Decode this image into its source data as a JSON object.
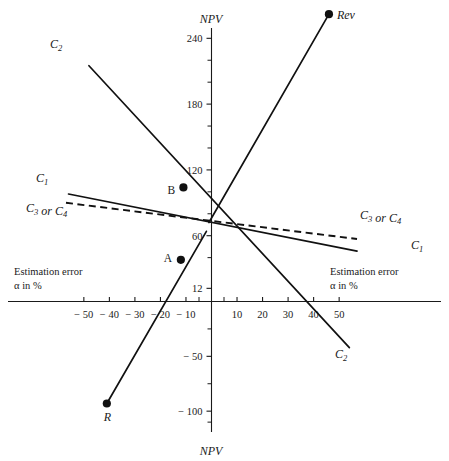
{
  "chart_data": {
    "type": "line",
    "title": "",
    "xlabel": "Estimation error α in %",
    "ylabel": "NPV",
    "axis_titles": {
      "y_top": "NPV",
      "y_bottom": "NPV",
      "x_left_line1": "Estimation error",
      "x_left_line2": "α in %",
      "x_right_line1": "Estimation error",
      "x_right_line2": "α in %"
    },
    "xlim": [
      -60,
      60
    ],
    "ylim": [
      -115,
      275
    ],
    "grid": false,
    "legend_position": "inline-endpoint-labels",
    "xticks": [
      -50,
      -40,
      -30,
      -20,
      -10,
      10,
      20,
      30,
      40,
      50
    ],
    "xtick_labels": [
      "− 50",
      "− 40",
      "− 30",
      "− 20",
      "− 10",
      "10",
      "20",
      "30",
      "40",
      "50"
    ],
    "yticks": [
      240,
      180,
      120,
      60,
      12,
      -50,
      -100
    ],
    "ytick_labels": [
      "240",
      "180",
      "120",
      "60",
      "12",
      "− 50",
      "− 100"
    ],
    "y_minor_ticks": [
      220,
      200,
      160,
      140,
      100,
      80,
      40,
      -25,
      -75,
      -110
    ],
    "origin_value": 75,
    "series": [
      {
        "name": "Rev",
        "label": "Rev",
        "style": "solid",
        "points": [
          [
            -1,
            72
          ],
          [
            46,
            262
          ]
        ],
        "endpoint_marker": [
          46,
          262
        ]
      },
      {
        "name": "C2",
        "label": "C₂",
        "style": "solid",
        "points": [
          [
            -48,
            215
          ],
          [
            54,
            -42
          ]
        ],
        "label_left": "C₂",
        "label_right": "C₂",
        "markers": [
          [
            -11,
            104
          ]
        ]
      },
      {
        "name": "R",
        "label": "R",
        "style": "solid",
        "points": [
          [
            -41,
            -93
          ],
          [
            -2,
            64
          ]
        ],
        "endpoint_marker": [
          -41,
          -93
        ],
        "markers": [
          [
            -12,
            38
          ]
        ]
      },
      {
        "name": "C1",
        "label": "C₁",
        "style": "solid",
        "points": [
          [
            -56,
            98
          ],
          [
            57,
            46
          ]
        ],
        "label_left": "C₁",
        "label_right": "C₁"
      },
      {
        "name": "C3_or_C4",
        "label": "C₃ or C₄",
        "style": "dashed",
        "points": [
          [
            -57,
            90
          ],
          [
            57,
            57
          ]
        ],
        "label_left": "C₃ or C₄",
        "label_right": "C₃ or C₄"
      }
    ],
    "annotations": [
      {
        "name": "point-A",
        "label": "A",
        "x": -12,
        "y": 38
      },
      {
        "name": "point-B",
        "label": "B",
        "x": -11,
        "y": 104
      },
      {
        "name": "point-R",
        "label": "R",
        "x": -41,
        "y": -93
      },
      {
        "name": "point-Rev",
        "label": "Rev",
        "x": 46,
        "y": 262
      }
    ],
    "colors": {
      "line": "#111111",
      "axis": "#1a1a1a",
      "background": "#ffffff",
      "marker": "#111111"
    }
  }
}
